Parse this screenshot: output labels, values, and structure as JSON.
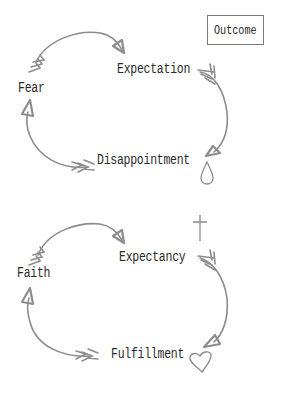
{
  "legend": {
    "outcome_label": "Outcome"
  },
  "cycles": [
    {
      "id": "fear-cycle",
      "nodes": {
        "left": "Fear",
        "top_right": "Expectation",
        "bottom_right": "Disappointment"
      },
      "flow": [
        "Fear",
        "Expectation",
        "Disappointment",
        "Fear"
      ],
      "outcome_icon": "teardrop-icon"
    },
    {
      "id": "faith-cycle",
      "nodes": {
        "left": "Faith",
        "top_right": "Expectancy",
        "bottom_right": "Fulfillment"
      },
      "flow": [
        "Faith",
        "Expectancy",
        "Fulfillment",
        "Faith"
      ],
      "decoration_icon": "cross-icon",
      "outcome_icon": "heart-icon"
    }
  ],
  "colors": {
    "arrow": "#8c8c8c",
    "text": "#2a2a2a",
    "box_border": "#7a7a7a",
    "background": "#ffffff"
  }
}
